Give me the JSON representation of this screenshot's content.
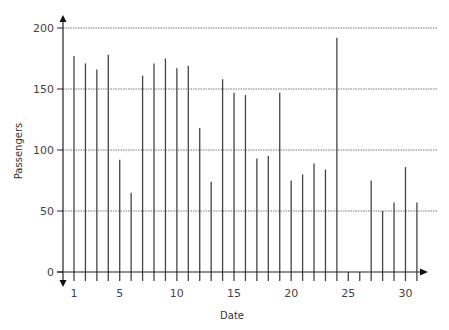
{
  "chart_data": {
    "type": "bar",
    "title": "",
    "xlabel": "Date",
    "ylabel": "Passengers",
    "ylim": [
      0,
      200
    ],
    "yticks": [
      0,
      50,
      100,
      150,
      200
    ],
    "xticks": [
      1,
      5,
      10,
      15,
      20,
      25,
      30
    ],
    "grid": "horizontal dotted",
    "legend": "none",
    "categories": [
      1,
      2,
      3,
      4,
      5,
      6,
      7,
      8,
      9,
      10,
      11,
      12,
      13,
      14,
      15,
      16,
      17,
      18,
      19,
      20,
      21,
      22,
      23,
      24,
      25,
      26,
      27,
      28,
      29,
      30,
      31
    ],
    "values": [
      177,
      171,
      166,
      178,
      92,
      65,
      161,
      171,
      175,
      167,
      169,
      118,
      74,
      158,
      147,
      145,
      93,
      95,
      147,
      75,
      80,
      89,
      84,
      192,
      0,
      0,
      75,
      50,
      57,
      86,
      57
    ],
    "bar_color": "#444444",
    "grid_color": "#555555"
  }
}
